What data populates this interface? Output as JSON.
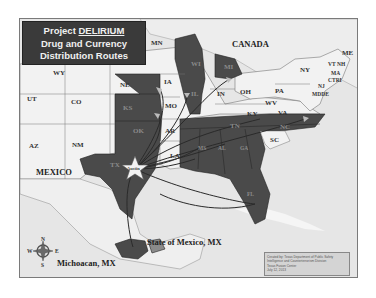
{
  "title": {
    "line1_prefix": "Project ",
    "line1_emph": "DELIRIUM",
    "line2": "Drug and Currency",
    "line3": "Distribution Routes"
  },
  "regions": {
    "canada": "CANADA",
    "mexico": "MEXICO"
  },
  "states": {
    "MN": "MN",
    "WY": "WY",
    "NE": "NE",
    "IA": "IA",
    "UT": "UT",
    "CO": "CO",
    "KS": "KS",
    "MO": "MO",
    "IL": "IL",
    "IN": "IN",
    "OH": "OH",
    "WI": "WI",
    "MI": "MI",
    "NY": "NY",
    "PA": "PA",
    "ME": "ME",
    "VT": "VT",
    "NH": "NH",
    "MA": "MA",
    "CT": "CT",
    "RI": "RI",
    "NJ": "NJ",
    "MD": "MD",
    "DE": "DE",
    "WV": "WV",
    "VA": "VA",
    "KY": "KY",
    "TN": "TN",
    "NC": "NC",
    "SC": "SC",
    "AZ": "AZ",
    "NM": "NM",
    "OK": "OK",
    "AR": "AR",
    "TX": "TX",
    "LA": "LA",
    "MS": "MS",
    "AL": "AL",
    "GA": "GA",
    "FL": "FL"
  },
  "origin": {
    "label": "Austin"
  },
  "source_labels": {
    "state_of_mexico": "State of Mexico, MX",
    "michoacan": "Michoacan, MX"
  },
  "compass": {
    "n": "N",
    "s": "S",
    "e": "E",
    "w": "W"
  },
  "credit": {
    "line1": "Created by: Texas Department of Public Safety",
    "line2": "Intelligence and Counterterrorism Division",
    "line3": "Texas Fusion Center",
    "line4": "July 12, 2013"
  },
  "colors": {
    "highlight_state": "#4a4a4a",
    "plain_state": "#f2f2f2",
    "water": "#e6e6e6",
    "title_bg": "#3a3a3a",
    "route_line": "#2a2a2a"
  }
}
